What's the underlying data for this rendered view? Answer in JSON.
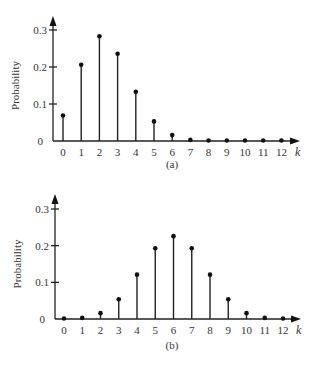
{
  "chart_data": [
    {
      "type": "bar",
      "subtype": "stem",
      "caption": "(a)",
      "title": "",
      "xlabel": "k",
      "ylabel": "Probability",
      "x": [
        0,
        1,
        2,
        3,
        4,
        5,
        6,
        7,
        8,
        9,
        10,
        11,
        12
      ],
      "categories": [
        "0",
        "1",
        "2",
        "3",
        "4",
        "5",
        "6",
        "7",
        "8",
        "9",
        "10",
        "11",
        "12"
      ],
      "values": [
        0.069,
        0.206,
        0.283,
        0.236,
        0.133,
        0.053,
        0.016,
        0.003,
        0.001,
        0.0,
        0.0,
        0.0,
        0.0
      ],
      "ylim": [
        0,
        0.3
      ],
      "yticks": [
        "0",
        "0.1",
        "0.2",
        "0.3"
      ],
      "grid": false,
      "legend": null
    },
    {
      "type": "bar",
      "subtype": "stem",
      "caption": "(b)",
      "title": "",
      "xlabel": "k",
      "ylabel": "Probability",
      "x": [
        0,
        1,
        2,
        3,
        4,
        5,
        6,
        7,
        8,
        9,
        10,
        11,
        12
      ],
      "categories": [
        "0",
        "1",
        "2",
        "3",
        "4",
        "5",
        "6",
        "7",
        "8",
        "9",
        "10",
        "11",
        "12"
      ],
      "values": [
        0.0002,
        0.003,
        0.016,
        0.054,
        0.121,
        0.193,
        0.226,
        0.193,
        0.121,
        0.054,
        0.016,
        0.003,
        0.0002
      ],
      "ylim": [
        0,
        0.3
      ],
      "yticks": [
        "0",
        "0.1",
        "0.2",
        "0.3"
      ],
      "grid": false,
      "legend": null
    }
  ],
  "colors": {
    "ink": "#222222",
    "background": "#ffffff"
  }
}
